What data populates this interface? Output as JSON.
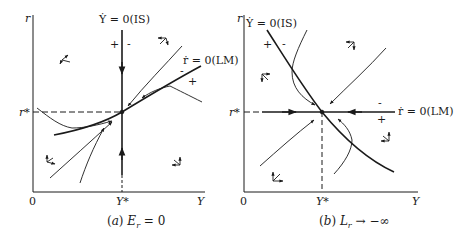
{
  "panels": [
    {
      "id": "a",
      "caption": "(a) E_r = 0",
      "caption_parts": {
        "prefix": "(",
        "letter": "a",
        "suffix": ")",
        "var": "E",
        "sub": "r",
        "rel": "= 0"
      },
      "axes": {
        "y_label": "r",
        "x_label": "Y",
        "origin": "0",
        "x_star": "Y*",
        "y_star": "r*"
      },
      "curves": {
        "is_label": "Ẏ = 0(IS)",
        "lm_label": "ṙ = 0(LM)",
        "is_shape": "vertical",
        "lm_shape": "upward-sloping"
      },
      "signs": {
        "is_left": "+",
        "is_right": "-",
        "lm_above": "-",
        "lm_below": "+"
      }
    },
    {
      "id": "b",
      "caption": "(b) L_r → −∞",
      "caption_parts": {
        "prefix": "(",
        "letter": "b",
        "suffix": ")",
        "var": "L",
        "sub": "r",
        "rel": "→ −∞"
      },
      "axes": {
        "y_label": "r",
        "x_label": "Y",
        "origin": "0",
        "x_star": "Y*",
        "y_star": "r*"
      },
      "curves": {
        "is_label": "Ẏ = 0(IS)",
        "lm_label": "ṙ = 0(LM)",
        "is_shape": "downward-sloping",
        "lm_shape": "horizontal"
      },
      "signs": {
        "is_left": "+",
        "is_right": "-",
        "lm_above": "-",
        "lm_below": "+"
      }
    }
  ],
  "colors": {
    "ink": "#1a1a1a",
    "background": "#ffffff"
  }
}
